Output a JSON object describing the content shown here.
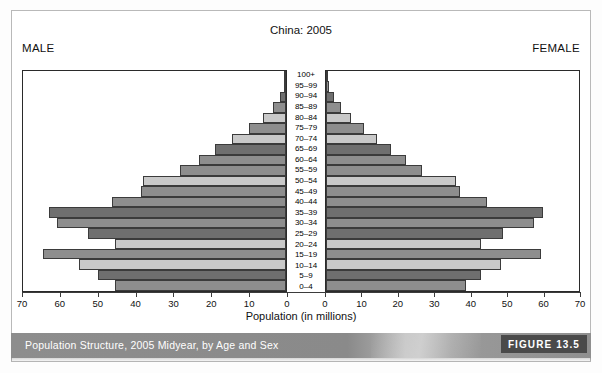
{
  "figure": {
    "title": "China: 2005",
    "male_label": "MALE",
    "female_label": "FEMALE",
    "xlabel": "Population (in millions)",
    "caption": "Population Structure, 2005 Midyear, by Age and Sex",
    "figure_number": "FIGURE 13.5"
  },
  "colors": {
    "bar_dark": "#6f6f6f",
    "bar_medium": "#8e8e8e",
    "bar_light": "#c9c9c9",
    "bar_border": "#3b3b3b",
    "axis": "#3b3b3b",
    "caption_bar": "#8d8d8d",
    "badge": "#4a4a4a"
  },
  "chart_data": {
    "type": "bar",
    "subtype": "population-pyramid",
    "title": "China: 2005",
    "xlabel": "Population (in millions)",
    "ylabel": "",
    "xlim_male": [
      70,
      0
    ],
    "xlim_female": [
      0,
      70
    ],
    "xticks": [
      0,
      10,
      20,
      30,
      40,
      50,
      60,
      70
    ],
    "grid": false,
    "legend": [
      "MALE",
      "FEMALE"
    ],
    "legend_position": "top-corners",
    "categories": [
      "100+",
      "95-99",
      "90-94",
      "85-89",
      "80-84",
      "75-79",
      "70-74",
      "65-69",
      "60-64",
      "55-59",
      "50-54",
      "45-49",
      "40-44",
      "35-39",
      "30-34",
      "25-29",
      "20-24",
      "15-19",
      "10-14",
      "5-9",
      "0-4"
    ],
    "series": [
      {
        "name": "MALE",
        "side": "left",
        "values": [
          0.1,
          0.6,
          1.6,
          3.4,
          6.1,
          9.8,
          14.3,
          19.0,
          23.2,
          28.2,
          38.0,
          38.5,
          46.3,
          63.0,
          61.0,
          52.8,
          45.5,
          64.8,
          55.0,
          50.0,
          45.5
        ]
      },
      {
        "name": "FEMALE",
        "side": "right",
        "values": [
          0.2,
          0.9,
          2.3,
          4.2,
          7.0,
          10.4,
          14.1,
          18.1,
          22.2,
          26.5,
          36.0,
          37.0,
          44.5,
          60.0,
          57.5,
          49.0,
          43.0,
          59.5,
          48.5,
          43.0,
          38.8
        ]
      }
    ],
    "bar_shades": [
      "medium",
      "medium",
      "dark",
      "medium",
      "light",
      "medium",
      "light",
      "dark",
      "medium",
      "medium",
      "light",
      "medium",
      "medium",
      "dark",
      "medium",
      "dark",
      "light",
      "medium",
      "light",
      "dark",
      "medium"
    ]
  }
}
